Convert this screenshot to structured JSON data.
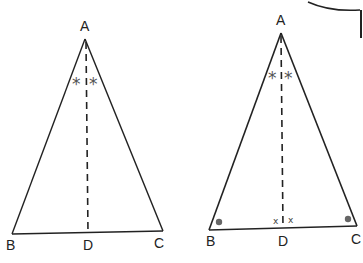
{
  "diagram": {
    "figures": [
      {
        "name": "triangle-1",
        "vertices": {
          "A": "A",
          "B": "B",
          "C": "C",
          "D": "D"
        },
        "angle_marks": {
          "apex_left": "*",
          "apex_right": "*"
        }
      },
      {
        "name": "triangle-2",
        "vertices": {
          "A": "A",
          "B": "B",
          "C": "C",
          "D": "D"
        },
        "angle_marks": {
          "apex_left": "*",
          "apex_right": "*",
          "foot_left": "x",
          "foot_right": "x"
        }
      }
    ],
    "colors": {
      "line": "#222222",
      "mark": "#555555",
      "dot": "#666666"
    }
  }
}
